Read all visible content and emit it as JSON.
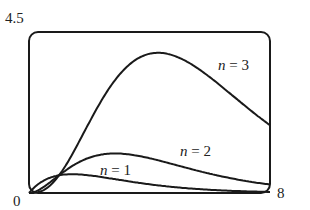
{
  "chart_data": {
    "type": "line",
    "title": "",
    "xlabel": "",
    "ylabel": "",
    "xlim": [
      0,
      8
    ],
    "ylim": [
      0,
      4.5
    ],
    "grid": false,
    "legend": "inline labels",
    "tick_labels": {
      "y_top": "4.5",
      "origin": "0",
      "x_right": "8"
    },
    "series": [
      {
        "name": "n = 1",
        "n": 1,
        "x": [
          0,
          0.5,
          1,
          1.43,
          2,
          3,
          4,
          5,
          6,
          7,
          8
        ],
        "values": [
          0,
          0.35,
          0.5,
          0.53,
          0.49,
          0.37,
          0.24,
          0.15,
          0.09,
          0.05,
          0.03
        ]
      },
      {
        "name": "n = 2",
        "n": 2,
        "x": [
          0,
          0.5,
          1,
          2,
          2.86,
          4,
          5,
          6,
          7,
          8
        ],
        "values": [
          0,
          0.18,
          0.5,
          0.99,
          1.1,
          0.98,
          0.75,
          0.54,
          0.37,
          0.24
        ]
      },
      {
        "name": "n = 3",
        "n": 3,
        "x": [
          0,
          1,
          2,
          3,
          4,
          4.3,
          5,
          6,
          7,
          8
        ],
        "values": [
          0,
          0.5,
          1.97,
          3.31,
          4.0,
          4.05,
          3.77,
          3.22,
          2.55,
          1.89
        ]
      }
    ],
    "annotations": [
      {
        "text": "n = 1",
        "x": 2.4,
        "y": 0.6
      },
      {
        "text": "n = 2",
        "x": 5.0,
        "y": 1.1
      },
      {
        "text": "n = 3",
        "x": 6.2,
        "y": 3.5
      }
    ]
  },
  "labels": {
    "y_top": "4.5",
    "origin": "0",
    "x_right": "8",
    "n1": {
      "var": "n",
      "rest": " = 1"
    },
    "n2": {
      "var": "n",
      "rest": " = 2"
    },
    "n3": {
      "var": "n",
      "rest": " = 3"
    }
  },
  "colors": {
    "line": "#1a1a1a",
    "frame": "#1a1a1a"
  }
}
